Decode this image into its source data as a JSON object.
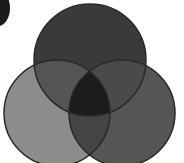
{
  "diagram": {
    "type": "venn",
    "sets": [
      {
        "id": "top",
        "cx": 90,
        "cy": 60,
        "r": 56,
        "color": "#3a3a3a"
      },
      {
        "id": "left",
        "cx": 57,
        "cy": 113,
        "r": 53,
        "color": "#8c8c8c"
      },
      {
        "id": "right",
        "cx": 122,
        "cy": 113,
        "r": 53,
        "color": "#555555"
      }
    ],
    "overlap_colors": {
      "top_left": "#555555",
      "top_right": "#4a4a4a",
      "left_right": "#444444",
      "all": "#1c1c1c"
    },
    "stroke": "#2a2a2a",
    "corner_shape_color": "#1a1a1a"
  }
}
